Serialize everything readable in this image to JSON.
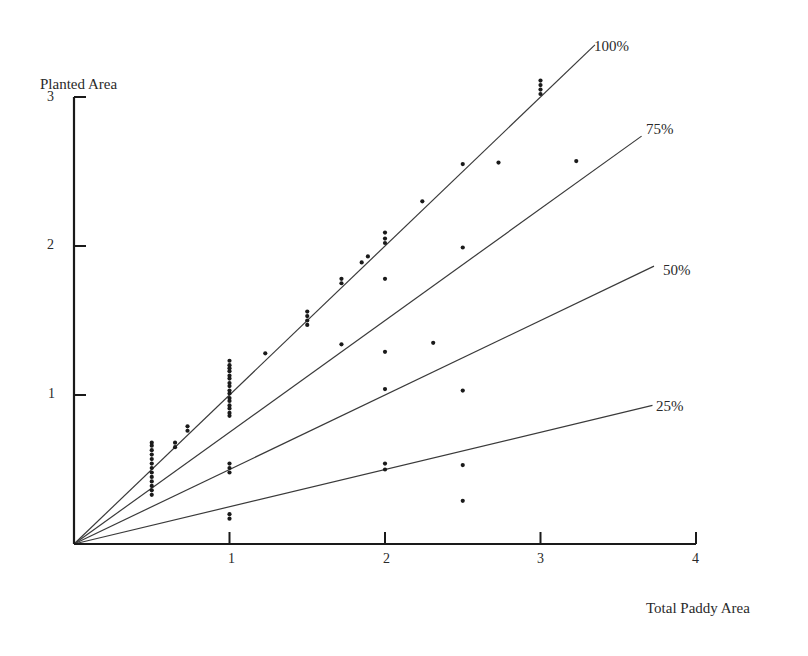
{
  "chart_data": {
    "type": "scatter",
    "title": "",
    "xlabel": "Total Paddy Area",
    "ylabel": "Planted Area",
    "xlim": [
      0,
      4
    ],
    "ylim": [
      0,
      3
    ],
    "x_ticks": [
      "1",
      "2",
      "3",
      "4"
    ],
    "y_ticks": [
      "1",
      "2",
      "3"
    ],
    "grid": false,
    "legend": null,
    "reference_lines": [
      {
        "label": "100%",
        "slope": 1.0,
        "x_end": 3.35
      },
      {
        "label": "75%",
        "slope": 0.75,
        "x_end": 3.65
      },
      {
        "label": "50%",
        "slope": 0.5,
        "x_end": 3.73
      },
      {
        "label": "25%",
        "slope": 0.25,
        "x_end": 3.72
      }
    ],
    "points": [
      [
        0.5,
        0.33
      ],
      [
        0.5,
        0.36
      ],
      [
        0.5,
        0.39
      ],
      [
        0.5,
        0.42
      ],
      [
        0.5,
        0.45
      ],
      [
        0.5,
        0.48
      ],
      [
        0.5,
        0.51
      ],
      [
        0.5,
        0.54
      ],
      [
        0.5,
        0.57
      ],
      [
        0.5,
        0.6
      ],
      [
        0.5,
        0.63
      ],
      [
        0.5,
        0.66
      ],
      [
        0.5,
        0.68
      ],
      [
        0.65,
        0.65
      ],
      [
        0.65,
        0.68
      ],
      [
        0.73,
        0.76
      ],
      [
        0.73,
        0.79
      ],
      [
        1.0,
        0.86
      ],
      [
        1.0,
        0.88
      ],
      [
        1.0,
        0.91
      ],
      [
        1.0,
        0.93
      ],
      [
        1.0,
        0.96
      ],
      [
        1.0,
        0.98
      ],
      [
        1.0,
        1.01
      ],
      [
        1.0,
        1.03
      ],
      [
        1.0,
        1.06
      ],
      [
        1.0,
        1.08
      ],
      [
        1.0,
        1.11
      ],
      [
        1.0,
        1.13
      ],
      [
        1.0,
        1.16
      ],
      [
        1.0,
        1.18
      ],
      [
        1.0,
        1.2
      ],
      [
        1.0,
        1.23
      ],
      [
        1.0,
        0.48
      ],
      [
        1.0,
        0.51
      ],
      [
        1.0,
        0.54
      ],
      [
        1.0,
        0.17
      ],
      [
        1.0,
        0.2
      ],
      [
        1.23,
        1.28
      ],
      [
        1.5,
        1.47
      ],
      [
        1.5,
        1.5
      ],
      [
        1.5,
        1.53
      ],
      [
        1.5,
        1.56
      ],
      [
        1.72,
        1.75
      ],
      [
        1.72,
        1.78
      ],
      [
        1.72,
        1.34
      ],
      [
        1.85,
        1.89
      ],
      [
        1.89,
        1.93
      ],
      [
        2.0,
        2.02
      ],
      [
        2.0,
        2.05
      ],
      [
        2.0,
        2.09
      ],
      [
        2.0,
        1.78
      ],
      [
        2.0,
        1.29
      ],
      [
        2.0,
        1.04
      ],
      [
        2.0,
        0.54
      ],
      [
        2.0,
        0.5
      ],
      [
        2.24,
        2.3
      ],
      [
        2.31,
        1.35
      ],
      [
        2.5,
        2.55
      ],
      [
        2.5,
        1.99
      ],
      [
        2.5,
        1.03
      ],
      [
        2.5,
        0.53
      ],
      [
        2.5,
        0.29
      ],
      [
        2.73,
        2.56
      ],
      [
        3.23,
        2.57
      ],
      [
        3.0,
        3.02
      ],
      [
        3.0,
        3.05
      ],
      [
        3.0,
        3.08
      ],
      [
        3.0,
        3.11
      ]
    ]
  },
  "axes": {
    "x_label": "Total Paddy Area",
    "y_label": "Planted Area",
    "x_tick_labels": [
      "1",
      "2",
      "3",
      "4"
    ],
    "y_tick_labels": [
      "1",
      "2",
      "3"
    ]
  },
  "line_labels": [
    "100%",
    "75%",
    "50%",
    "25%"
  ],
  "colors": {
    "ink": "#1a1a1a",
    "line": "#3a3a3a",
    "text": "#2a2a2a"
  }
}
